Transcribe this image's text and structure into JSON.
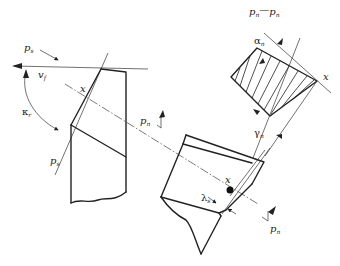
{
  "diagram": {
    "labels": {
      "ps_top": {
        "main": "p",
        "sub": "s"
      },
      "vf": {
        "main": "v",
        "sub": "f"
      },
      "kr": {
        "main": "κ",
        "sub": "r"
      },
      "ps_bottom": {
        "main": "p",
        "sub": "s"
      },
      "x_left": "x",
      "pn_mid": {
        "main": "p",
        "sub": "n"
      },
      "section_title": {
        "a": "p",
        "a_sub": "n",
        "sep": "—",
        "b": "p",
        "b_sub": "n"
      },
      "alpha_n": {
        "main": "α",
        "sub": "n"
      },
      "x_section": "x",
      "gamma_n": {
        "main": "γ",
        "sub": "n"
      },
      "x_mid": "x",
      "lambda_s": {
        "main": "λ",
        "sub": "s"
      },
      "pn_bottom": {
        "main": "p",
        "sub": "n"
      }
    },
    "caption": ""
  }
}
